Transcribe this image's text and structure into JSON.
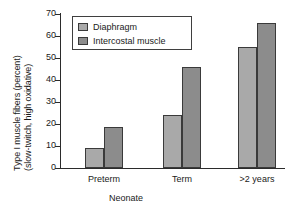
{
  "chart_data": {
    "type": "bar",
    "title": "",
    "xlabel": "Neonate",
    "ylabel_line1": "Type I muscle fibers (percent)",
    "ylabel_line2": "(slow-twitch, high oxidative)",
    "categories": [
      "Preterm",
      "Term",
      ">2 years"
    ],
    "series": [
      {
        "name": "Diaphragm",
        "color": "#a9a9a9",
        "values": [
          9,
          24,
          55
        ]
      },
      {
        "name": "Intercostal muscle",
        "color": "#8c8c8c",
        "values": [
          18.5,
          46,
          66
        ]
      }
    ],
    "ylim": [
      0,
      70
    ],
    "yticks": [
      70,
      60,
      50,
      40,
      30,
      20,
      10,
      0
    ],
    "grid": false,
    "legend_position": "top-left-inside"
  },
  "legend": {
    "items": [
      {
        "label": "Diaphragm"
      },
      {
        "label": "Intercostal muscle"
      }
    ]
  }
}
